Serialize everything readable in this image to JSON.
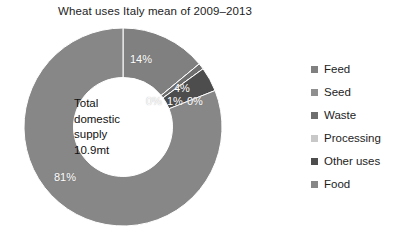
{
  "chart_data": {
    "type": "pie",
    "variant": "donut",
    "title": "Wheat uses Italy mean of 2009–2013",
    "xlabel": "",
    "ylabel": "",
    "legend_position": "right",
    "grid": false,
    "start_angle_deg": 0,
    "direction": "clockwise",
    "inner_radius_ratio": 0.5,
    "categories": [
      "Feed",
      "Seed",
      "Waste",
      "Processing",
      "Other uses",
      "Food"
    ],
    "values": [
      14,
      0,
      1,
      0,
      4,
      81
    ],
    "data_labels": [
      "14%",
      "0%",
      "1%",
      "0%",
      "4%",
      "81%"
    ],
    "colors": [
      "#808080",
      "#8f8f8f",
      "#6e6e6e",
      "#c8c8c8",
      "#4d4d4d",
      "#878787"
    ],
    "center_annotation": {
      "line1": "Total",
      "line2": "domestic",
      "line3": "supply",
      "line4": "10.9mt"
    },
    "annotations": [
      {
        "label": "14%",
        "category": "Feed"
      },
      {
        "label": "4%",
        "category": "Other uses"
      },
      {
        "label": "0%",
        "category": "Seed"
      },
      {
        "label": "1%",
        "category": "Waste"
      },
      {
        "label": "0%",
        "category": "Processing"
      },
      {
        "label": "81%",
        "category": "Food"
      }
    ]
  },
  "legend": {
    "items": [
      {
        "label": "Feed",
        "color": "#808080"
      },
      {
        "label": "Seed",
        "color": "#8f8f8f"
      },
      {
        "label": "Waste",
        "color": "#6e6e6e"
      },
      {
        "label": "Processing",
        "color": "#c8c8c8"
      },
      {
        "label": "Other uses",
        "color": "#4d4d4d"
      },
      {
        "label": "Food",
        "color": "#878787"
      }
    ]
  },
  "slice_labels": {
    "feed": "14%",
    "seed": "0%",
    "waste": "1%",
    "processing": "0%",
    "other_uses": "4%",
    "food": "81%"
  }
}
